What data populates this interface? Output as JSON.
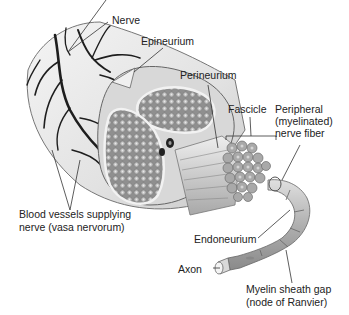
{
  "diagram": {
    "labels": {
      "nerve": "Nerve",
      "epineurium": "Epineurium",
      "perineurium": "Perineurium",
      "fascicle": "Fascicle",
      "peripheral_fiber_1": "Peripheral",
      "peripheral_fiber_2": "(myelinated)",
      "peripheral_fiber_3": "nerve fiber",
      "blood_vessels_1": "Blood vessels supplying",
      "blood_vessels_2": "nerve (vasa nervorum)",
      "endoneurium": "Endoneurium",
      "axon": "Axon",
      "myelin_gap_1": "Myelin sheath gap",
      "myelin_gap_2": "(node of Ranvier)"
    },
    "colors": {
      "background": "#ffffff",
      "text": "#222222",
      "leader_line": "#333333",
      "nerve_body": "#e6e6e6",
      "fascicle_fill": "#9a9a9a",
      "vessel": "#1e1e1e",
      "fiber": "#b5b5b5"
    }
  }
}
